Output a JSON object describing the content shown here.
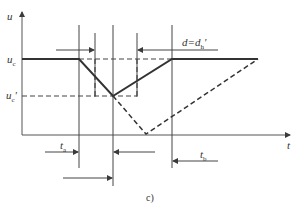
{
  "diagram": {
    "caption": "c)",
    "axes": {
      "y_label": "u",
      "x_label": "t"
    },
    "levels": {
      "uc": {
        "label": "u",
        "sub": "c",
        "prime": ""
      },
      "uc_prime": {
        "label": "u",
        "sub": "c",
        "prime": "'"
      }
    },
    "annotations": {
      "d_eq": {
        "text": "d=d",
        "sub": "h",
        "prime": "'"
      },
      "ta": {
        "label": "t",
        "sub": "a"
      },
      "tb": {
        "label": "t",
        "sub": "b"
      }
    },
    "colors": {
      "line": "#3a3a3a",
      "background": "#ffffff"
    }
  }
}
